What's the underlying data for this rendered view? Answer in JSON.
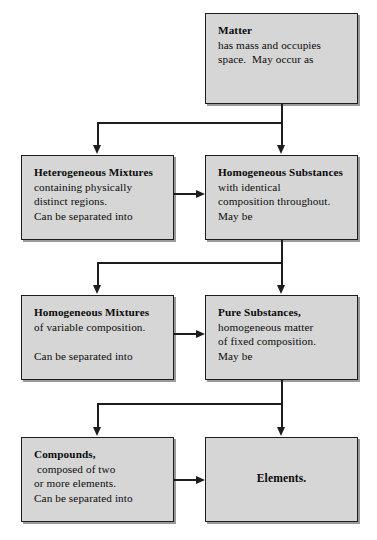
{
  "diagram": {
    "box_fill_color": "#d6d6d6",
    "box_border_color": "#1d1d1d",
    "connector_color": "#1d1d1d",
    "background_color": "#ffffff"
  },
  "boxes": {
    "matter": {
      "name": "Matter",
      "lines": [
        "Matter",
        "has mass and occupies",
        "space.  May occur as"
      ]
    },
    "heterogeneous_mixtures": {
      "name": "Heterogeneous Mixtures",
      "lines": [
        "Heterogeneous Mixtures",
        "containing physically",
        "distinct regions.",
        "Can be separated into"
      ]
    },
    "homogeneous_substances": {
      "name": "Homogeneous Substances",
      "lines": [
        "Homogeneous Substances",
        "with identical",
        "composition throughout.",
        "May be"
      ]
    },
    "homogeneous_mixtures": {
      "name": "Homogeneous Mixtures",
      "lines": [
        "Homogeneous Mixtures",
        "of variable composition.",
        "",
        "Can be separated into"
      ]
    },
    "pure_substances": {
      "name": "Pure Substances",
      "lines": [
        "Pure Substances,",
        "homogeneous matter",
        "of fixed composition.",
        "May be"
      ]
    },
    "compounds": {
      "name": "Compounds",
      "lines": [
        "Compounds,",
        " composed of two",
        "or more elements.",
        "Can be separated into"
      ]
    },
    "elements": {
      "name": "Elements",
      "lines": [
        "Elements."
      ]
    }
  },
  "connectors": [
    {
      "name": "matter-to-row2",
      "from": "matter",
      "to": [
        "heterogeneous_mixtures",
        "homogeneous_substances"
      ],
      "type": "split-down"
    },
    {
      "name": "heterogeneous-to-homogeneous",
      "from": "heterogeneous_mixtures",
      "to": [
        "homogeneous_substances"
      ],
      "type": "arrow-right"
    },
    {
      "name": "homogeneous-substances-to-row3",
      "from": "homogeneous_substances",
      "to": [
        "homogeneous_mixtures",
        "pure_substances"
      ],
      "type": "split-down"
    },
    {
      "name": "homogeneous-mixtures-to-pure-substances",
      "from": "homogeneous_mixtures",
      "to": [
        "pure_substances"
      ],
      "type": "arrow-right"
    },
    {
      "name": "pure-substances-to-row4",
      "from": "pure_substances",
      "to": [
        "compounds",
        "elements"
      ],
      "type": "split-down"
    },
    {
      "name": "compounds-to-elements",
      "from": "compounds",
      "to": [
        "elements"
      ],
      "type": "arrow-right"
    }
  ]
}
